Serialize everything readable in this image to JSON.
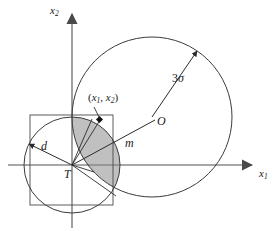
{
  "figure": {
    "kind": "geometry-diagram",
    "width": 279,
    "height": 231,
    "background_color": "#ffffff",
    "stroke_color": "#3b3b3b",
    "axis_color": "#6e6e6e",
    "shade_color": "#b9b9b9"
  },
  "axes": {
    "x_label": "x",
    "x_subscript": "1",
    "y_label": "x",
    "y_subscript": "2",
    "origin_x": 72,
    "origin_y": 165
  },
  "labels": {
    "point": "(x₁, x₂)",
    "point_open": "(",
    "point_var1": "x",
    "point_sub1": "1",
    "point_sep": ", ",
    "point_var2": "x",
    "point_sub2": "2",
    "point_close": ")",
    "radius": "3σ",
    "radius_number": "3",
    "radius_symbol": "σ",
    "center_big": "O",
    "distance_m": "m",
    "distance_d": "d",
    "target_T": "T"
  },
  "shapes": {
    "big_circle": {
      "cx": 152,
      "cy": 117,
      "r": 80,
      "label": "3σ"
    },
    "small_circle": {
      "cx": 72,
      "cy": 165,
      "r": 48,
      "label": "d"
    },
    "square": {
      "x": 30,
      "y": 115,
      "width": 83,
      "height": 90
    },
    "target_point": {
      "x": 72,
      "y": 165,
      "label": "T"
    },
    "sample_point": {
      "x": 100,
      "y": 120,
      "label": "(x₁, x₂)"
    },
    "shaded_region": {
      "name": "lens-intersection",
      "fill": "#b9b9b9",
      "opacity": 0.85
    }
  }
}
